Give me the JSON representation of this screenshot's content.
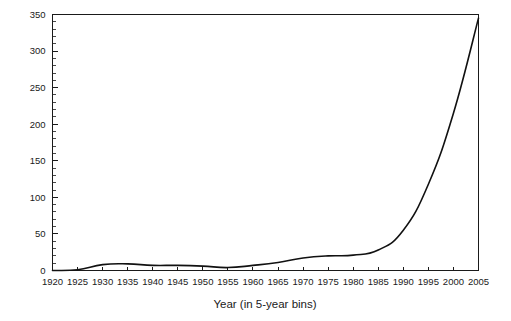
{
  "chart_data": {
    "type": "line",
    "title": "",
    "subtitle": "",
    "xlabel": "Year (in 5-year bins)",
    "ylabel": "",
    "categories": [
      1920,
      1925,
      1930,
      1935,
      1940,
      1945,
      1950,
      1955,
      1960,
      1965,
      1970,
      1975,
      1980,
      1985,
      1990,
      1995,
      2000,
      2005
    ],
    "x_tick_labels": [
      "1920",
      "1925",
      "1930",
      "1935",
      "1940",
      "1945",
      "1950",
      "1955",
      "1960",
      "1965",
      "1970",
      "1975",
      "1980",
      "1985",
      "1990",
      "1995",
      "2000",
      "2005"
    ],
    "y_tick_labels": [
      "0",
      "50",
      "100",
      "150",
      "200",
      "250",
      "300",
      "350"
    ],
    "y_ticks": [
      0,
      50,
      100,
      150,
      200,
      250,
      300,
      350
    ],
    "values": [
      0,
      1,
      8,
      9,
      7,
      7,
      6,
      4,
      7,
      11,
      17,
      20,
      21,
      28,
      55,
      118,
      215,
      345
    ],
    "xlim": [
      1920,
      2005
    ],
    "ylim": [
      0,
      350
    ],
    "y_minor_step": 10,
    "grid": false,
    "legend": null,
    "line_color": "#111111",
    "axis_color": "#1a1a1a",
    "background_color": "#ffffff"
  }
}
